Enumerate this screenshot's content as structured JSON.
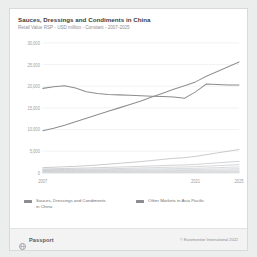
{
  "card": {
    "title": "Sauces, Dressings and Condiments in China",
    "subtitle": "Retail Value RSP - USD million - Constant - 2007-2025"
  },
  "footer": {
    "brand": "Passport",
    "brand_icon": "globe-icon",
    "copyright": "© Euromonitor International 2022"
  },
  "legend": {
    "position": "bottom",
    "items": [
      {
        "label": "Sauces, Dressings and Condiments in China",
        "color": "#8a8c8f",
        "icon": "legend-swatch"
      },
      {
        "label": "Other Markets in Asia Pacific",
        "color": "#8a8c8f",
        "icon": "legend-swatch"
      }
    ]
  },
  "chart_data": {
    "type": "line",
    "title": "Sauces, Dressings and Condiments in China",
    "subtitle": "Retail Value RSP - USD million - Constant - 2007-2025",
    "xlabel": "",
    "ylabel": "",
    "grid": true,
    "xlim": [
      2007,
      2025
    ],
    "ylim": [
      0,
      30000
    ],
    "x": [
      2007,
      2008,
      2009,
      2010,
      2011,
      2012,
      2013,
      2014,
      2015,
      2016,
      2017,
      2018,
      2019,
      2020,
      2021,
      2022,
      2023,
      2024,
      2025
    ],
    "xtick_labels": [
      "2007",
      "2021",
      "2025"
    ],
    "xtick_values": [
      2007,
      2021,
      2025
    ],
    "ytick_labels": [
      "0",
      "5,000",
      "10,000",
      "15,000",
      "20,000",
      "25,000",
      "30,000"
    ],
    "ytick_values": [
      0,
      5000,
      10000,
      15000,
      20000,
      25000,
      30000
    ],
    "series": [
      {
        "name": "Sauces, Dressings and Condiments in China",
        "color": "#8a8c8f",
        "values": [
          19500,
          19900,
          20100,
          19600,
          18700,
          18300,
          18100,
          18000,
          17900,
          17800,
          17700,
          17650,
          17500,
          17200,
          18700,
          20500,
          20400,
          20300,
          20300
        ]
      },
      {
        "name": "Other Markets in Asia Pacific",
        "color": "#8a8c8f",
        "values": [
          9700,
          10300,
          11000,
          11800,
          12600,
          13400,
          14200,
          15000,
          15800,
          16600,
          17500,
          18400,
          19300,
          20100,
          21000,
          22300,
          23400,
          24500,
          25600
        ]
      },
      {
        "name": "Other Markets in Asia Pacific",
        "color": "#a9abae",
        "values": [
          1200,
          1300,
          1400,
          1500,
          1650,
          1800,
          2000,
          2200,
          2400,
          2600,
          2850,
          3100,
          3350,
          3500,
          3800,
          4200,
          4600,
          5000,
          5400
        ]
      },
      {
        "name": "Other Markets in Asia Pacific",
        "color": "#b4b6b9",
        "values": [
          900,
          950,
          1000,
          1060,
          1120,
          1190,
          1260,
          1340,
          1420,
          1500,
          1590,
          1680,
          1780,
          1820,
          1950,
          2120,
          2300,
          2480,
          2650
        ]
      },
      {
        "name": "Other Markets in Asia Pacific",
        "color": "#bcbec1",
        "values": [
          700,
          730,
          770,
          810,
          850,
          900,
          950,
          1000,
          1060,
          1120,
          1180,
          1250,
          1320,
          1350,
          1430,
          1540,
          1660,
          1780,
          1900
        ]
      },
      {
        "name": "Other Markets in Asia Pacific",
        "color": "#c2c4c7",
        "values": [
          560,
          580,
          605,
          630,
          660,
          690,
          725,
          760,
          800,
          840,
          885,
          930,
          975,
          995,
          1045,
          1120,
          1200,
          1285,
          1370
        ]
      },
      {
        "name": "Other Markets in Asia Pacific",
        "color": "#c8cacd",
        "values": [
          430,
          445,
          462,
          480,
          500,
          522,
          545,
          570,
          596,
          624,
          654,
          685,
          716,
          728,
          762,
          812,
          866,
          922,
          980
        ]
      },
      {
        "name": "Other Markets in Asia Pacific",
        "color": "#cdcfd2",
        "values": [
          330,
          340,
          352,
          364,
          378,
          393,
          409,
          426,
          444,
          463,
          483,
          504,
          525,
          533,
          556,
          590,
          626,
          664,
          703
        ]
      },
      {
        "name": "Other Markets in Asia Pacific",
        "color": "#d1d3d6",
        "values": [
          245,
          252,
          260,
          268,
          277,
          287,
          297,
          308,
          320,
          333,
          346,
          360,
          374,
          379,
          394,
          417,
          441,
          467,
          493
        ]
      },
      {
        "name": "Other Markets in Asia Pacific",
        "color": "#d4d6d9",
        "values": [
          170,
          175,
          180,
          186,
          192,
          198,
          205,
          212,
          220,
          228,
          237,
          246,
          255,
          258,
          268,
          283,
          299,
          316,
          333
        ]
      },
      {
        "name": "Other Markets in Asia Pacific",
        "color": "#d7d9dc",
        "values": [
          110,
          113,
          116,
          120,
          124,
          128,
          132,
          137,
          142,
          147,
          152,
          158,
          164,
          166,
          172,
          181,
          191,
          202,
          213
        ]
      },
      {
        "name": "Other Markets in Asia Pacific",
        "color": "#dadcdf",
        "values": [
          65,
          67,
          69,
          71,
          73,
          75,
          78,
          80,
          83,
          86,
          89,
          92,
          95,
          96,
          100,
          105,
          111,
          117,
          123
        ]
      },
      {
        "name": "Other Markets in Asia Pacific",
        "color": "#dcdee1",
        "values": [
          30,
          31,
          32,
          33,
          34,
          35,
          36,
          37,
          38,
          40,
          41,
          43,
          44,
          45,
          46,
          49,
          51,
          54,
          57
        ]
      }
    ]
  }
}
